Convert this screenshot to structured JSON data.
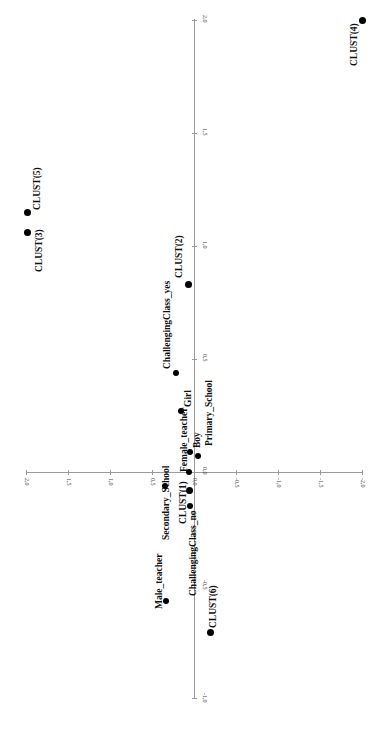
{
  "chart_data": {
    "type": "scatter",
    "title": "",
    "orientation_note_visible": "plot rendered rotated 90 degrees",
    "xlabel": "",
    "ylabel": "",
    "axis_long": {
      "ticks": [
        "2,0",
        "1,5",
        "1,0",
        "0,5",
        "0,0",
        "-0,5",
        "-1,0"
      ],
      "values": [
        2.0,
        1.5,
        1.0,
        0.5,
        0.0,
        -0.5,
        -1.0
      ],
      "range": [
        -1.0,
        2.0
      ]
    },
    "axis_short": {
      "ticks": [
        "2,0",
        "1,5",
        "1,0",
        "0,5",
        "0,0",
        "-0,5",
        "-1,0",
        "-1,5",
        "-2,0"
      ],
      "values": [
        2.0,
        1.5,
        1.0,
        0.5,
        0.0,
        -0.5,
        -1.0,
        -1.5,
        -2.0
      ],
      "range": [
        -2.0,
        2.0
      ]
    },
    "grid": false,
    "legend": null,
    "points": [
      {
        "label": "CLUST(4)",
        "f1": 2.0,
        "f2": -2.01,
        "big": true
      },
      {
        "label": "CLUST(5)",
        "f1": 1.15,
        "f2": 1.98,
        "big": true
      },
      {
        "label": "CLUST(3)",
        "f1": 1.06,
        "f2": 1.98,
        "big": true
      },
      {
        "label": "CLUST(2)",
        "f1": 0.83,
        "f2": 0.07,
        "big": true
      },
      {
        "label": "ChallengingClass_yes",
        "f1": 0.44,
        "f2": 0.21,
        "big": false
      },
      {
        "label": "Girl",
        "f1": 0.27,
        "f2": 0.15,
        "big": false
      },
      {
        "label": "Boy",
        "f1": 0.09,
        "f2": 0.05,
        "big": false
      },
      {
        "label": "Primary_School",
        "f1": 0.07,
        "f2": -0.05,
        "big": false
      },
      {
        "label": "Female_teacher",
        "f1": 0.0,
        "f2": 0.06,
        "big": false
      },
      {
        "label": "Secondary_School",
        "f1": -0.06,
        "f2": 0.35,
        "big": false
      },
      {
        "label": "CLUST(1)",
        "f1": -0.08,
        "f2": 0.05,
        "big": true
      },
      {
        "label": "ChallengingClass_no",
        "f1": -0.15,
        "f2": 0.05,
        "big": false
      },
      {
        "label": "Male_teacher",
        "f1": -0.57,
        "f2": 0.33,
        "big": false
      },
      {
        "label": "CLUST(6)",
        "f1": -0.71,
        "f2": -0.2,
        "big": true
      }
    ]
  },
  "layout": {
    "origin_x": 194,
    "origin_y": 472,
    "px_per_unit_long": 226,
    "px_per_unit_short": 84,
    "labels": {
      "CLUST(4)": {
        "dx": -14,
        "dy": 46
      },
      "CLUST(5)": {
        "dx": 4,
        "dy": -2
      },
      "CLUST(3)": {
        "dx": 6,
        "dy": 40
      },
      "CLUST(2)": {
        "dx": -14,
        "dy": -6
      },
      "ChallengingClass_yes": {
        "dx": -14,
        "dy": -4
      },
      "Girl": {
        "dx": 2,
        "dy": -4
      },
      "Boy": {
        "dx": 2,
        "dy": -4
      },
      "Primary_School": {
        "dx": 6,
        "dy": -10
      },
      "Female_teacher": {
        "dx": -10,
        "dy": 0
      },
      "Secondary_School": {
        "dx": -4,
        "dy": 54
      },
      "CLUST(1)": {
        "dx": -12,
        "dy": 34
      },
      "ChallengingClass_no": {
        "dx": -2,
        "dy": 90
      },
      "Male_teacher": {
        "dx": -12,
        "dy": 8
      },
      "CLUST(6)": {
        "dx": -3,
        "dy": -4
      }
    }
  }
}
